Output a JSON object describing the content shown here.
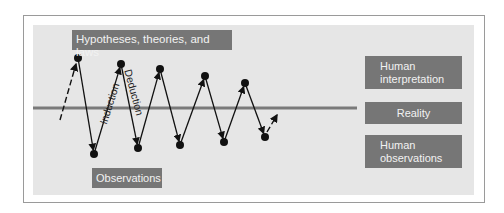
{
  "diagram": {
    "labels": {
      "top": "Hypotheses, theories, and laws",
      "bottom": "Observations",
      "induction": "Induction",
      "deduction": "Deduction"
    },
    "legend": [
      {
        "label": "Human interpretation"
      },
      {
        "label": "Reality"
      },
      {
        "label": "Human observations"
      }
    ],
    "legend_lines": {
      "interp_1": "Human",
      "interp_2": "interpretation",
      "reality": "Reality",
      "obs_1": "Human",
      "obs_2": "observations"
    },
    "reality_line": {
      "x1": 33,
      "x2": 357,
      "y": 108,
      "color": "#7a7a7a"
    },
    "zigzag_points": [
      [
        78,
        58
      ],
      [
        94,
        154
      ],
      [
        121,
        64
      ],
      [
        138,
        148
      ],
      [
        160,
        69
      ],
      [
        180,
        145
      ],
      [
        205,
        76
      ],
      [
        224,
        142
      ],
      [
        245,
        83
      ],
      [
        265,
        137
      ]
    ],
    "dashed_in": {
      "from": [
        60,
        120
      ],
      "to": [
        76,
        64
      ]
    },
    "dashed_out": {
      "from": [
        267,
        132
      ],
      "to": [
        277,
        115
      ]
    },
    "colors": {
      "panel": "#e6e6e6",
      "box": "#767676",
      "box_text": "#f2f2f2",
      "line": "#111111"
    }
  }
}
